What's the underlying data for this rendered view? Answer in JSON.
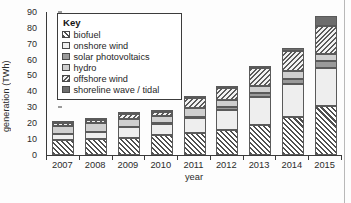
{
  "chart_data": {
    "type": "bar",
    "subtype": "stacked",
    "title": "",
    "xlabel": "year",
    "ylabel": "generation (TWh)",
    "ylim": [
      0,
      90
    ],
    "ytick_step": 10,
    "yticks": [
      0,
      10,
      20,
      30,
      40,
      50,
      60,
      70,
      80,
      90
    ],
    "grid": false,
    "legend_title": "Key",
    "legend_position": "top-left-inside",
    "categories": [
      "2007",
      "2008",
      "2009",
      "2010",
      "2011",
      "2012",
      "2013",
      "2014",
      "2015"
    ],
    "series": [
      {
        "name": "biofuel",
        "pattern": "diagonal-hatch-dark",
        "values": [
          9.3,
          9.7,
          10.7,
          12.5,
          13.4,
          15.2,
          18.8,
          23.8,
          30.4
        ]
      },
      {
        "name": "onshore wind",
        "pattern": "solid-light",
        "values": [
          3.6,
          4.6,
          6.4,
          6.9,
          9.6,
          12.9,
          17.8,
          21.0,
          24.2
        ]
      },
      {
        "name": "solar photovoltaics",
        "pattern": "solid-dark-grey",
        "values": [
          0.2,
          0.2,
          0.3,
          0.4,
          0.8,
          1.6,
          2.3,
          3.2,
          4.2
        ]
      },
      {
        "name": "hydro",
        "pattern": "solid-mid-grey",
        "values": [
          5.0,
          5.2,
          5.3,
          4.8,
          5.4,
          5.0,
          4.6,
          5.0,
          4.8
        ]
      },
      {
        "name": "offshore wind",
        "pattern": "diagonal-hatch-fine",
        "values": [
          1.5,
          2.0,
          3.0,
          2.0,
          6.5,
          7.5,
          11.0,
          12.5,
          17.8
        ]
      },
      {
        "name": "shoreline wave / tidal",
        "pattern": "solid-darkest",
        "values": [
          0.2,
          0.2,
          0.2,
          0.2,
          0.5,
          0.8,
          1.3,
          1.8,
          5.8
        ]
      }
    ],
    "totals": [
      19.8,
      21.9,
      25.9,
      26.8,
      36.2,
      43.0,
      55.8,
      67.3,
      87.2
    ]
  },
  "legend": {
    "title": "Key",
    "items": [
      {
        "label": "biofuel"
      },
      {
        "label": "onshore wind"
      },
      {
        "label": "solar photovoltaics"
      },
      {
        "label": "hydro"
      },
      {
        "label": "offshore wind"
      },
      {
        "label": "shoreline wave / tidal"
      }
    ]
  },
  "colors": {
    "axis": "#3a3a3a",
    "text": "#2b2b2b",
    "biofuel": "#4f4f4f",
    "onshore_wind": "#eeeeee",
    "solar_photovoltaics": "#9a9a9a",
    "hydro": "#cfcfcf",
    "offshore_wind": "#5a5a5a",
    "shoreline_wave_tidal": "#6d6d6d",
    "background": "#fdfdfd"
  }
}
